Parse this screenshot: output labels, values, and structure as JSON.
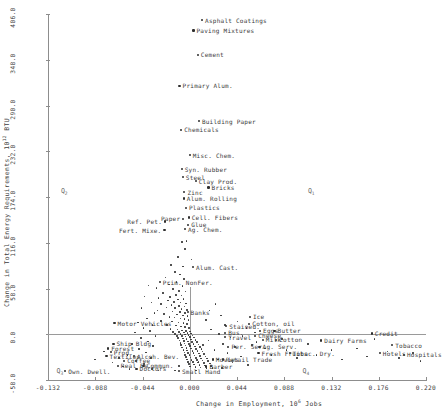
{
  "chart_data": {
    "type": "scatter",
    "title": "",
    "xlabel": "Change in Employment, 10^6 Jobs",
    "xlabel_main": "Change in Employment, 10",
    "xlabel_exp": "6",
    "xlabel_tail": " Jobs",
    "ylabel": "Change in Total Energy Requirements, 10^12 BTU",
    "ylabel_main": "Change in Total Energy Requirements, 10",
    "ylabel_exp": "12",
    "ylabel_tail": " BTU",
    "xlim": [
      -0.132,
      0.22
    ],
    "ylim": [
      -58.0,
      406.0
    ],
    "grid": false,
    "legend": null,
    "xticks": [
      "-0.132",
      "-0.088",
      "-0.044",
      "0.000",
      "0.044",
      "0.088",
      "0.132",
      "0.176",
      "0.220"
    ],
    "xtick_values": [
      -0.132,
      -0.088,
      -0.044,
      0.0,
      0.044,
      0.088,
      0.132,
      0.176,
      0.22
    ],
    "yticks": [
      "406.0",
      "348.0",
      "290.0",
      "232.0",
      "174.0",
      "116.0",
      "58.0",
      "0.0",
      "-58.0"
    ],
    "ytick_values": [
      406.0,
      348.0,
      290.0,
      232.0,
      174.0,
      116.0,
      58.0,
      0.0,
      -58.0
    ],
    "quadrant_labels": [
      {
        "text": "Q",
        "sub": "2",
        "x": -0.12,
        "y": 182.0
      },
      {
        "text": "Q",
        "sub": "1",
        "x": 0.11,
        "y": 182.0
      },
      {
        "text": "Q",
        "sub": "3",
        "x": -0.124,
        "y": -46.0
      },
      {
        "text": "Q",
        "sub": "4",
        "x": 0.105,
        "y": -46.0
      }
    ],
    "labeled_points": [
      {
        "label": "Asphalt Coatings",
        "x": 0.0115,
        "y": 398.0,
        "anchor": "left"
      },
      {
        "label": "Paving Mixtures",
        "x": 0.0035,
        "y": 385.0,
        "anchor": "left"
      },
      {
        "label": "Cement",
        "x": 0.0075,
        "y": 354.0,
        "anchor": "left"
      },
      {
        "label": "Primary Alum.",
        "x": -0.0095,
        "y": 315.0,
        "anchor": "left"
      },
      {
        "label": "Building Paper",
        "x": 0.0085,
        "y": 270.0,
        "anchor": "left"
      },
      {
        "label": "Chemicals",
        "x": -0.008,
        "y": 259.0,
        "anchor": "left"
      },
      {
        "label": "Misc. Chem.",
        "x": 0.0,
        "y": 227.0,
        "anchor": "left"
      },
      {
        "label": "Syn. Rubber",
        "x": -0.0075,
        "y": 209.0,
        "anchor": "left"
      },
      {
        "label": "Steel",
        "x": -0.0065,
        "y": 199.0,
        "anchor": "left"
      },
      {
        "label": "Clay Prod.",
        "x": 0.0055,
        "y": 194.0,
        "anchor": "left"
      },
      {
        "label": "Bricks",
        "x": 0.0175,
        "y": 186.0,
        "anchor": "left"
      },
      {
        "label": "Zinc",
        "x": -0.005,
        "y": 180.0,
        "anchor": "left"
      },
      {
        "label": "Alum. Rolling",
        "x": -0.0055,
        "y": 172.0,
        "anchor": "left"
      },
      {
        "label": "Plastics",
        "x": -0.0035,
        "y": 160.0,
        "anchor": "left"
      },
      {
        "label": "Cell. Fibers",
        "x": -0.001,
        "y": 148.0,
        "anchor": "left"
      },
      {
        "label": "Paper",
        "x": -0.006,
        "y": 146.0,
        "anchor": "right"
      },
      {
        "label": "Ref. Pet.",
        "x": -0.023,
        "y": 143.0,
        "anchor": "right"
      },
      {
        "label": "Glue",
        "x": -0.0015,
        "y": 139.0,
        "anchor": "left"
      },
      {
        "label": "Ag. Chem.",
        "x": -0.0045,
        "y": 133.0,
        "anchor": "left"
      },
      {
        "label": "Fert. Mixe.",
        "x": -0.0235,
        "y": 132.0,
        "anchor": "right"
      },
      {
        "label": "Alum. Cast.",
        "x": 0.003,
        "y": 85.0,
        "anchor": "left"
      },
      {
        "label": "Prim. NonFer.",
        "x": -0.028,
        "y": 66.0,
        "anchor": "left"
      },
      {
        "label": "Banks",
        "x": -0.002,
        "y": 28.0,
        "anchor": "left"
      },
      {
        "label": "Ice",
        "x": 0.056,
        "y": 22.0,
        "anchor": "left"
      },
      {
        "label": "Motor Vehicles",
        "x": -0.07,
        "y": 14.0,
        "anchor": "left"
      },
      {
        "label": "Cotton, oil",
        "x": 0.0555,
        "y": 13.0,
        "anchor": "left"
      },
      {
        "label": "Stained.",
        "x": 0.034,
        "y": 10.0,
        "anchor": "left"
      },
      {
        "label": "Eggs",
        "x": 0.0655,
        "y": 4.0,
        "anchor": "left"
      },
      {
        "label": "Butter",
        "x": 0.079,
        "y": 4.0,
        "anchor": "left"
      },
      {
        "label": "Bus.",
        "x": 0.033,
        "y": 2.0,
        "anchor": "left"
      },
      {
        "label": "Travel",
        "x": 0.033,
        "y": -4.0,
        "anchor": "left"
      },
      {
        "label": "Cheese",
        "x": 0.061,
        "y": -2.0,
        "anchor": "left"
      },
      {
        "label": "Milk",
        "x": 0.068,
        "y": -7.0,
        "anchor": "left"
      },
      {
        "label": "Cotton",
        "x": 0.0805,
        "y": -7.0,
        "anchor": "left"
      },
      {
        "label": "Dairy Farms",
        "x": 0.1225,
        "y": -8.0,
        "anchor": "left"
      },
      {
        "label": "Credit",
        "x": 0.1695,
        "y": 1.0,
        "anchor": "left"
      },
      {
        "label": "Ship Bldg.",
        "x": -0.071,
        "y": -12.0,
        "anchor": "left"
      },
      {
        "label": "Forest",
        "x": -0.076,
        "y": -18.0,
        "anchor": "left"
      },
      {
        "label": "Prod.",
        "x": -0.0735,
        "y": -23.0,
        "anchor": "left"
      },
      {
        "label": "Textiles",
        "x": -0.0775,
        "y": -28.0,
        "anchor": "left"
      },
      {
        "label": "Alcoh. Bev.",
        "x": -0.052,
        "y": -28.0,
        "anchor": "left"
      },
      {
        "label": "Per. Ser.",
        "x": 0.036,
        "y": -16.0,
        "anchor": "left"
      },
      {
        "label": "Ag. Serv.",
        "x": 0.065,
        "y": -16.0,
        "anchor": "left"
      },
      {
        "label": "Tobacco",
        "x": 0.1885,
        "y": -14.0,
        "anchor": "left"
      },
      {
        "label": "Fresh Fruits",
        "x": 0.064,
        "y": -24.0,
        "anchor": "left"
      },
      {
        "label": "Tobac. Dry.",
        "x": 0.093,
        "y": -24.0,
        "anchor": "left"
      },
      {
        "label": "Hotels",
        "x": 0.177,
        "y": -24.0,
        "anchor": "left"
      },
      {
        "label": "Hospitals",
        "x": 0.1995,
        "y": -26.0,
        "anchor": "left"
      },
      {
        "label": "Movies",
        "x": 0.0215,
        "y": -32.0,
        "anchor": "left"
      },
      {
        "label": "Retail Trade",
        "x": 0.031,
        "y": -32.0,
        "anchor": "left"
      },
      {
        "label": "Coffee",
        "x": -0.061,
        "y": -34.0,
        "anchor": "left"
      },
      {
        "label": "Real Es.",
        "x": -0.067,
        "y": -40.0,
        "anchor": "left"
      },
      {
        "label": "Commun.",
        "x": -0.043,
        "y": -40.0,
        "anchor": "left"
      },
      {
        "label": "Doctors",
        "x": -0.0495,
        "y": -44.0,
        "anchor": "left"
      },
      {
        "label": "Barber",
        "x": 0.0155,
        "y": -41.0,
        "anchor": "left"
      },
      {
        "label": "Own. Dwell.",
        "x": -0.116,
        "y": -47.0,
        "anchor": "left"
      },
      {
        "label": "Small Hand",
        "x": -0.01,
        "y": -47.0,
        "anchor": "left"
      }
    ],
    "cloud_points": [
      [
        -0.0031,
        118.0
      ],
      [
        -0.0072,
        117.0
      ],
      [
        -0.0045,
        108.0
      ],
      [
        -0.0108,
        98.0
      ],
      [
        0.0016,
        95.0
      ],
      [
        -0.0175,
        88.0
      ],
      [
        -0.0062,
        86.0
      ],
      [
        -0.014,
        79.0
      ],
      [
        -0.009,
        76.0
      ],
      [
        -0.0225,
        72.0
      ],
      [
        -0.0052,
        70.0
      ],
      [
        -0.0122,
        66.0
      ],
      [
        -0.0195,
        63.0
      ],
      [
        -0.0068,
        61.0
      ],
      [
        -0.031,
        59.0
      ],
      [
        -0.0155,
        57.0
      ],
      [
        -0.0098,
        55.0
      ],
      [
        -0.004,
        54.0
      ],
      [
        -0.025,
        52.0
      ],
      [
        -0.0128,
        50.0
      ],
      [
        -0.0078,
        49.0
      ],
      [
        -0.0185,
        47.0
      ],
      [
        -0.029,
        46.0
      ],
      [
        -0.0058,
        45.0
      ],
      [
        -0.0112,
        44.0
      ],
      [
        -0.0205,
        43.0
      ],
      [
        -0.0148,
        41.0
      ],
      [
        -0.0085,
        40.0
      ],
      [
        -0.0036,
        39.0
      ],
      [
        -0.0265,
        38.0
      ],
      [
        -0.017,
        37.0
      ],
      [
        -0.0102,
        36.0
      ],
      [
        -0.0048,
        35.0
      ],
      [
        -0.0218,
        34.0
      ],
      [
        -0.0135,
        33.0
      ],
      [
        -0.0075,
        32.0
      ],
      [
        -0.0028,
        31.0
      ],
      [
        -0.03,
        30.0
      ],
      [
        -0.016,
        29.0
      ],
      [
        -0.0092,
        28.0
      ],
      [
        -0.0042,
        27.0
      ],
      [
        -0.024,
        26.0
      ],
      [
        -0.0118,
        25.0
      ],
      [
        -0.0065,
        24.0
      ],
      [
        -0.002,
        23.0
      ],
      [
        -0.019,
        22.0
      ],
      [
        -0.0142,
        21.0
      ],
      [
        -0.0088,
        20.0
      ],
      [
        -0.005,
        19.0
      ],
      [
        -0.0012,
        18.0
      ],
      [
        -0.027,
        17.0
      ],
      [
        -0.0165,
        16.0
      ],
      [
        -0.0105,
        15.0
      ],
      [
        -0.006,
        14.0
      ],
      [
        -0.0026,
        13.0
      ],
      [
        -0.021,
        12.0
      ],
      [
        -0.013,
        11.0
      ],
      [
        -0.0082,
        10.0
      ],
      [
        -0.0044,
        9.0
      ],
      [
        -0.0008,
        8.0
      ],
      [
        -0.018,
        7.0
      ],
      [
        -0.0115,
        6.0
      ],
      [
        -0.007,
        5.0
      ],
      [
        -0.0035,
        4.0
      ],
      [
        0.0002,
        3.5
      ],
      [
        -0.0155,
        3.0
      ],
      [
        -0.0098,
        2.5
      ],
      [
        -0.0056,
        2.0
      ],
      [
        -0.0022,
        1.5
      ],
      [
        0.0014,
        1.0
      ],
      [
        -0.0135,
        0.5
      ],
      [
        -0.0086,
        0.0
      ],
      [
        -0.0046,
        -0.5
      ],
      [
        -0.001,
        -1.0
      ],
      [
        0.0026,
        -1.5
      ],
      [
        -0.012,
        -2.0
      ],
      [
        -0.0074,
        -2.5
      ],
      [
        -0.0038,
        -3.0
      ],
      [
        0.0,
        -3.5
      ],
      [
        0.004,
        -4.0
      ],
      [
        -0.0108,
        -5.0
      ],
      [
        -0.0064,
        -5.5
      ],
      [
        -0.003,
        -6.0
      ],
      [
        0.001,
        -6.5
      ],
      [
        0.0052,
        -7.0
      ],
      [
        -0.0096,
        -8.0
      ],
      [
        -0.0056,
        -8.5
      ],
      [
        -0.0018,
        -9.0
      ],
      [
        0.0022,
        -9.5
      ],
      [
        0.0066,
        -10.0
      ],
      [
        -0.0088,
        -11.0
      ],
      [
        -0.0048,
        -11.5
      ],
      [
        -0.0006,
        -12.0
      ],
      [
        0.0036,
        -12.5
      ],
      [
        0.008,
        -13.0
      ],
      [
        -0.008,
        -14.0
      ],
      [
        -0.004,
        -14.5
      ],
      [
        0.0004,
        -15.0
      ],
      [
        0.0048,
        -15.5
      ],
      [
        0.0094,
        -16.0
      ],
      [
        -0.007,
        -17.0
      ],
      [
        -0.0032,
        -17.5
      ],
      [
        0.0014,
        -18.0
      ],
      [
        0.006,
        -18.5
      ],
      [
        0.0108,
        -19.0
      ],
      [
        -0.006,
        -20.0
      ],
      [
        -0.0024,
        -20.5
      ],
      [
        0.0026,
        -21.0
      ],
      [
        0.0072,
        -21.5
      ],
      [
        0.012,
        -22.0
      ],
      [
        -0.005,
        -23.0
      ],
      [
        -0.0014,
        -23.5
      ],
      [
        0.0034,
        -24.0
      ],
      [
        0.0084,
        -24.5
      ],
      [
        0.0132,
        -25.0
      ],
      [
        -0.0042,
        -26.0
      ],
      [
        -0.0004,
        -26.5
      ],
      [
        0.0044,
        -27.0
      ],
      [
        0.0096,
        -27.5
      ],
      [
        0.0146,
        -28.0
      ],
      [
        -0.0034,
        -29.0
      ],
      [
        0.0006,
        -29.5
      ],
      [
        0.0056,
        -30.0
      ],
      [
        0.0106,
        -30.5
      ],
      [
        0.016,
        -31.0
      ],
      [
        -0.0026,
        -32.0
      ],
      [
        0.0018,
        -32.5
      ],
      [
        0.0068,
        -33.0
      ],
      [
        0.0118,
        -33.5
      ],
      [
        0.0172,
        -34.0
      ],
      [
        -0.0018,
        -35.0
      ],
      [
        0.003,
        -35.5
      ],
      [
        0.0078,
        -36.0
      ],
      [
        0.013,
        -36.5
      ],
      [
        0.0186,
        -37.0
      ],
      [
        -0.0008,
        -38.0
      ],
      [
        0.004,
        -38.5
      ],
      [
        0.009,
        -39.0
      ],
      [
        0.0142,
        -39.5
      ],
      [
        0.0198,
        -40.0
      ],
      [
        0.0002,
        -41.0
      ],
      [
        0.0052,
        -41.5
      ],
      [
        0.0102,
        -42.0
      ],
      [
        0.0155,
        -42.5
      ],
      [
        0.021,
        -43.0
      ],
      [
        -0.0385,
        62.0
      ],
      [
        -0.042,
        48.0
      ],
      [
        -0.0355,
        40.0
      ],
      [
        -0.045,
        33.0
      ],
      [
        -0.033,
        27.0
      ],
      [
        -0.04,
        20.0
      ],
      [
        -0.048,
        15.0
      ],
      [
        -0.0345,
        12.0
      ],
      [
        -0.043,
        8.0
      ],
      [
        -0.037,
        4.0
      ],
      [
        -0.051,
        2.0
      ],
      [
        -0.032,
        -2.0
      ],
      [
        -0.0455,
        -5.0
      ],
      [
        -0.039,
        -9.0
      ],
      [
        -0.054,
        -12.0
      ],
      [
        -0.034,
        -15.0
      ],
      [
        -0.047,
        -19.0
      ],
      [
        -0.041,
        -23.0
      ],
      [
        -0.058,
        -26.0
      ],
      [
        -0.036,
        -30.0
      ],
      [
        -0.05,
        -34.0
      ],
      [
        -0.0425,
        -38.0
      ],
      [
        -0.062,
        -41.0
      ],
      [
        -0.035,
        -44.0
      ],
      [
        -0.029,
        -46.0
      ],
      [
        0.024,
        38.0
      ],
      [
        0.0185,
        30.0
      ],
      [
        0.029,
        24.0
      ],
      [
        0.015,
        18.0
      ],
      [
        0.033,
        12.0
      ],
      [
        0.02,
        6.0
      ],
      [
        0.027,
        0.0
      ],
      [
        0.038,
        -4.0
      ],
      [
        0.0175,
        -8.0
      ],
      [
        0.031,
        -12.0
      ],
      [
        0.042,
        -16.0
      ],
      [
        0.023,
        -20.0
      ],
      [
        0.035,
        -24.0
      ],
      [
        0.048,
        -28.0
      ],
      [
        0.0265,
        -32.0
      ],
      [
        0.04,
        -36.0
      ],
      [
        0.054,
        -39.0
      ],
      [
        0.03,
        -43.0
      ],
      [
        0.062,
        -10.0
      ],
      [
        0.07,
        -18.0
      ],
      [
        0.076,
        -26.0
      ],
      [
        0.086,
        -6.0
      ],
      [
        0.09,
        -20.0
      ],
      [
        0.1,
        -30.0
      ],
      [
        0.11,
        -12.0
      ],
      [
        0.118,
        -26.0
      ],
      [
        0.132,
        -20.0
      ],
      [
        0.142,
        -32.0
      ],
      [
        0.156,
        -18.0
      ],
      [
        0.165,
        -28.0
      ],
      [
        0.172,
        -6.0
      ],
      [
        0.184,
        -22.0
      ],
      [
        0.195,
        -30.0
      ],
      [
        0.208,
        -24.0
      ],
      [
        0.215,
        -34.0
      ],
      [
        0.0445,
        16.0
      ],
      [
        0.053,
        8.0
      ],
      [
        0.049,
        -2.0
      ],
      [
        0.061,
        2.0
      ],
      [
        0.058,
        -14.0
      ],
      [
        -0.066,
        -30.0
      ],
      [
        -0.072,
        -36.0
      ],
      [
        -0.08,
        -22.0
      ],
      [
        -0.088,
        -32.0
      ],
      [
        -0.056,
        -44.0
      ],
      [
        -0.014,
        -46.0
      ],
      [
        0.006,
        -46.0
      ],
      [
        0.008,
        -35.0
      ],
      [
        -0.01,
        -40.0
      ],
      [
        0.0125,
        -14.0
      ]
    ],
    "marker_color": "#2e2e2e",
    "axis_color": "#8d8d8d",
    "text_color": "#3a3a3a"
  }
}
